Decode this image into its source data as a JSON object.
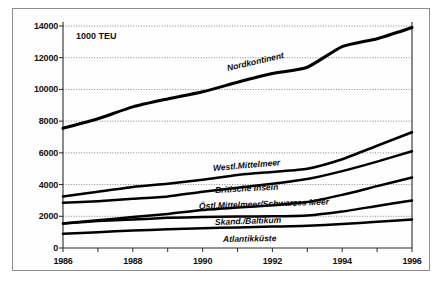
{
  "chart_data": {
    "type": "line",
    "title": "",
    "subtitle": "",
    "unit_label": "1000 TEU",
    "xlabel": "",
    "ylabel": "",
    "x": [
      1986,
      1987,
      1988,
      1989,
      1990,
      1991,
      1992,
      1993,
      1994,
      1995,
      1996
    ],
    "xlim": [
      1986,
      1996
    ],
    "ylim": [
      0,
      14000
    ],
    "xticks": [
      1986,
      1987,
      1988,
      1989,
      1990,
      1991,
      1992,
      1993,
      1994,
      1995,
      1996
    ],
    "xtick_labels": [
      "1986",
      "",
      "1988",
      "",
      "1990",
      "",
      "1992",
      "",
      "1994",
      "",
      "1996"
    ],
    "xtick_labels_shown": [
      "1986",
      "1988",
      "1990",
      "1992",
      "1994",
      "1996"
    ],
    "yticks": [
      0,
      2000,
      4000,
      6000,
      8000,
      10000,
      12000,
      14000
    ],
    "ytick_labels": [
      "0",
      "2000",
      "4000",
      "6000",
      "8000",
      "10000",
      "12000",
      "14000"
    ],
    "grid": true,
    "grid_style": "dotted-horizontal",
    "legend": "inline-labels",
    "line_color": "#000000",
    "series": [
      {
        "name": "Nordkontinent",
        "values": [
          7550,
          8150,
          8900,
          9400,
          9850,
          10450,
          11000,
          11400,
          12700,
          13200,
          13900
        ]
      },
      {
        "name": "Westl.Mittelmeer",
        "values": [
          3250,
          3550,
          3850,
          4050,
          4300,
          4600,
          4800,
          5000,
          5600,
          6450,
          7300
        ]
      },
      {
        "name": "Britische Inseln",
        "values": [
          2850,
          2950,
          3100,
          3250,
          3550,
          3800,
          4050,
          4350,
          4850,
          5450,
          6100
        ]
      },
      {
        "name": "Östl.Mittelmeer/Schwarzes Meer",
        "values": [
          1550,
          1750,
          1950,
          2150,
          2400,
          2550,
          2700,
          2900,
          3350,
          3900,
          4450
        ]
      },
      {
        "name": "Skand./Baltikum",
        "values": [
          1550,
          1700,
          1800,
          1900,
          1950,
          1980,
          2000,
          2050,
          2300,
          2650,
          3000
        ]
      },
      {
        "name": "Atlantikküste",
        "values": [
          900,
          1000,
          1100,
          1180,
          1250,
          1300,
          1350,
          1400,
          1520,
          1650,
          1800
        ]
      }
    ]
  },
  "annotations": {
    "unit": "1000 TEU",
    "series_labels": [
      {
        "text": "Nordkontinent",
        "x": 227,
        "y": 63,
        "rotation": -13
      },
      {
        "text": "Westl.Mittelmeer",
        "x": 213,
        "y": 163,
        "rotation": -5
      },
      {
        "text": "Britische Inseln",
        "x": 215,
        "y": 185,
        "rotation": -3
      },
      {
        "text": "Östl.Mittelmeer/Schwarzes Meer",
        "x": 199,
        "y": 201,
        "rotation": -2
      },
      {
        "text": "Skand./Baltikum",
        "x": 215,
        "y": 217,
        "rotation": -2
      },
      {
        "text": "Atlantikküste",
        "x": 223,
        "y": 234,
        "rotation": -1
      }
    ]
  }
}
